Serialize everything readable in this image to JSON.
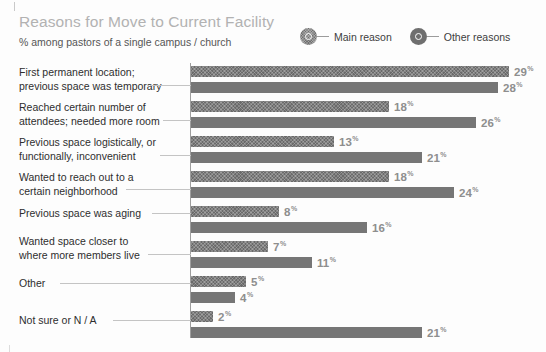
{
  "header": {
    "title": "Reasons for Move to Current Facility",
    "subtitle": "% among pastors of a single campus / church"
  },
  "legend": {
    "items": [
      {
        "label": "Main reason",
        "marker": "hatched-circle-marker",
        "color": "#6f6f6f"
      },
      {
        "label": "Other reasons",
        "marker": "solid-circle-marker",
        "color": "#6f6f6f"
      }
    ]
  },
  "chart_data": {
    "type": "bar",
    "orientation": "horizontal",
    "title": "Reasons for Move to Current Facility",
    "subtitle": "% among pastors of a single campus / church",
    "xlabel": "",
    "ylabel": "",
    "unit": "%",
    "grid": false,
    "legend_position": "top-right",
    "categories": [
      "First permanent location; previous space was temporary",
      "Reached certain number of attendees; needed more room",
      "Previous space logistically, or functionally, inconvenient",
      "Wanted to reach out to a certain neighborhood",
      "Previous space was aging",
      "Wanted space closer to where more members live",
      "Other",
      "Not sure or N / A"
    ],
    "series": [
      {
        "name": "Main reason",
        "values": [
          29,
          18,
          13,
          18,
          8,
          7,
          5,
          2
        ]
      },
      {
        "name": "Other reasons",
        "values": [
          28,
          26,
          21,
          24,
          16,
          11,
          4,
          21
        ]
      }
    ],
    "value_labels": {
      "Main reason": [
        "29",
        "18",
        "13",
        "18",
        "8",
        "7",
        "5",
        "2"
      ],
      "Other reasons": [
        "28",
        "26",
        "21",
        "24",
        "16",
        "11",
        "4",
        "21"
      ]
    }
  },
  "categories": [
    {
      "lines": [
        "First permanent location;",
        "previous space was temporary"
      ],
      "label_top": 8,
      "connector_top": 27,
      "connector_left": 150,
      "connector_width": 41,
      "main": {
        "value": 29,
        "label": "29",
        "top": 8,
        "width": 318
      },
      "other": {
        "value": 28,
        "label": "28",
        "top": 24,
        "width": 307
      }
    },
    {
      "lines": [
        "Reached certain number of",
        "attendees; needed more room"
      ],
      "label_top": 43,
      "connector_top": 62,
      "connector_left": 163,
      "connector_width": 28,
      "main": {
        "value": 18,
        "label": "18",
        "top": 43,
        "width": 198
      },
      "other": {
        "value": 26,
        "label": "26",
        "top": 59,
        "width": 285
      }
    },
    {
      "lines": [
        "Previous space logistically, or",
        "functionally, inconvenient"
      ],
      "label_top": 78,
      "connector_top": 97,
      "connector_left": 160,
      "connector_width": 31,
      "main": {
        "value": 13,
        "label": "13",
        "top": 78,
        "width": 143
      },
      "other": {
        "value": 21,
        "label": "21",
        "top": 94,
        "width": 231
      }
    },
    {
      "lines": [
        "Wanted to reach out to a",
        "certain neighborhood"
      ],
      "label_top": 113,
      "connector_top": 131,
      "connector_left": 126,
      "connector_width": 65,
      "main": {
        "value": 18,
        "label": "18",
        "top": 113,
        "width": 198
      },
      "other": {
        "value": 24,
        "label": "24",
        "top": 129,
        "width": 263
      }
    },
    {
      "lines": [
        "Previous space was aging"
      ],
      "label_top": 149,
      "connector_top": 155,
      "connector_left": 152,
      "connector_width": 39,
      "main": {
        "value": 8,
        "label": "8",
        "top": 148,
        "width": 88
      },
      "other": {
        "value": 16,
        "label": "16",
        "top": 164,
        "width": 176
      }
    },
    {
      "lines": [
        "Wanted space closer to",
        "where more members live"
      ],
      "label_top": 177,
      "connector_top": 196,
      "connector_left": 148,
      "connector_width": 43,
      "main": {
        "value": 7,
        "label": "7",
        "top": 183,
        "width": 77
      },
      "other": {
        "value": 11,
        "label": "11",
        "top": 199,
        "width": 121
      }
    },
    {
      "lines": [
        "Other"
      ],
      "label_top": 219,
      "connector_top": 225,
      "connector_left": 60,
      "connector_width": 131,
      "main": {
        "value": 5,
        "label": "5",
        "top": 218,
        "width": 55
      },
      "other": {
        "value": 4,
        "label": "4",
        "top": 234,
        "width": 44
      }
    },
    {
      "lines": [
        "Not sure or N / A"
      ],
      "label_top": 256,
      "connector_top": 262,
      "connector_left": 113,
      "connector_width": 78,
      "main": {
        "value": 2,
        "label": "2",
        "top": 253,
        "width": 22
      },
      "other": {
        "value": 21,
        "label": "21",
        "top": 269,
        "width": 231
      }
    }
  ]
}
